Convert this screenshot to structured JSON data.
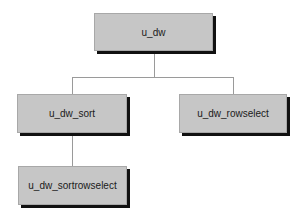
{
  "diagram": {
    "type": "inheritance-tree",
    "colors": {
      "node_fill": "#c6c6c6",
      "node_border": "#a8a8a8",
      "node_shadow": "#111111",
      "connector": "#9a9a9a",
      "background": "#ffffff"
    },
    "nodes": [
      {
        "id": "u_dw",
        "label": "u_dw"
      },
      {
        "id": "u_dw_sort",
        "label": "u_dw_sort"
      },
      {
        "id": "u_dw_rowselect",
        "label": "u_dw_rowselect"
      },
      {
        "id": "u_dw_sortrowselect",
        "label": "u_dw_sortrowselect"
      }
    ],
    "edges": [
      {
        "from": "u_dw",
        "to": "u_dw_sort"
      },
      {
        "from": "u_dw",
        "to": "u_dw_rowselect"
      },
      {
        "from": "u_dw_sort",
        "to": "u_dw_sortrowselect"
      }
    ]
  }
}
